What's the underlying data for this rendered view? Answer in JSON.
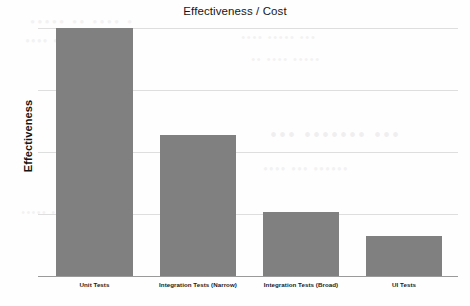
{
  "chart_data": {
    "type": "bar",
    "title": "Effectiveness / Cost",
    "xlabel": "",
    "ylabel": "Effectiveness",
    "categories": [
      "Unit Tests",
      "Integration Tests (Narrow)",
      "Integration Tests (Broad)",
      "UI Tests"
    ],
    "values": [
      100,
      57,
      26,
      16
    ],
    "ylim": [
      0,
      100
    ],
    "grid": true,
    "gridlines": [
      0,
      25,
      50,
      75,
      100
    ],
    "legend": "none",
    "bar_color": "#808080",
    "gridline_color": "#dedede",
    "axis_color": "#9a9a9a",
    "tick_labels_y": [],
    "annotations": []
  },
  "background_artifacts": {
    "note": "faint illegible show-through text from reverse of scanned page",
    "lines": [
      "• •••• •• •••••",
      "•••••• •• ••••",
      "••• ••••• ••••",
      "••••• •••• ••",
      "••• ••••••• •••",
      "•••••• ••• ••••",
      "•••• •••••"
    ]
  }
}
